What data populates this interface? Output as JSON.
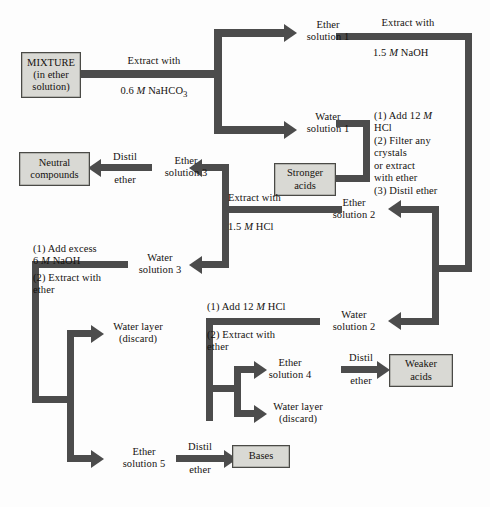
{
  "diagram": {
    "colors": {
      "connector": "#4c4c4c",
      "box_fill": "#d9d9d4",
      "box_border": "#4a4a46",
      "text": "#15120f",
      "background": "#ffffff"
    },
    "boxes": [
      {
        "id": "mixture",
        "label": "MIXTURE\n(in ether\nsolution)"
      },
      {
        "id": "neutral",
        "label": "Neutral\ncompounds"
      },
      {
        "id": "stronger_acids",
        "label": "Stronger\nacids"
      },
      {
        "id": "weaker_acids",
        "label": "Weaker\nacids"
      },
      {
        "id": "bases",
        "label": "Bases"
      }
    ],
    "nodes": [
      {
        "id": "ether1",
        "label": "Ether\nsolution 1"
      },
      {
        "id": "water1",
        "label": "Water\nsolution 1"
      },
      {
        "id": "ether2",
        "label": "Ether\nsolution 2"
      },
      {
        "id": "water2",
        "label": "Water\nsolution 2"
      },
      {
        "id": "ether3",
        "label": "Ether\nsolution 3"
      },
      {
        "id": "water3",
        "label": "Water\nsolution 3"
      },
      {
        "id": "ether4",
        "label": "Ether\nsolution 4"
      },
      {
        "id": "ether5",
        "label": "Ether\nsolution 5"
      },
      {
        "id": "water_layer_top",
        "label": "Water layer\n(discard)"
      },
      {
        "id": "water_layer_bottom",
        "label": "Water layer\n(discard)"
      }
    ],
    "edge_labels": {
      "extract_nahco3_line1": "Extract with",
      "extract_nahco3_line2_pre": "0.6 ",
      "extract_nahco3_m": "M",
      "extract_nahco3_line2_post": " NaHCO",
      "extract_nahco3_sub": "3",
      "extract_naoh_line1": "Extract with",
      "extract_naoh_line2_pre": "1.5 ",
      "extract_naoh_m": "M",
      "extract_naoh_line2_post": " NaOH",
      "distil_ether_top_1": "Distil",
      "distil_ether_top_2": "ether",
      "hcl_steps_1_pre": "(1) Add 12 ",
      "hcl_steps_1_m": "M",
      "hcl_steps_1_post": "\n      HCl",
      "hcl_steps_2": "(2) Filter any\n      crystals\n      or extract\n      with ether",
      "hcl_steps_3": "(3) Distil ether",
      "extract_hcl_line1": "Extract with",
      "extract_hcl_line2_pre": "1.5 ",
      "extract_hcl_m": "M",
      "extract_hcl_line2_post": " HCl",
      "naoh_excess_1_pre": "(1) Add excess\n      6 ",
      "naoh_excess_m": "M",
      "naoh_excess_1_post": " NaOH",
      "naoh_excess_2": "(2) Extract with\n      ether",
      "hcl12_1_pre": "(1) Add 12 ",
      "hcl12_m": "M",
      "hcl12_1_post": " HCl",
      "hcl12_2": "(2) Extract with\n      ether",
      "distil_ether_weak_1": "Distil",
      "distil_ether_weak_2": "ether",
      "distil_ether_bases_1": "Distil",
      "distil_ether_bases_2": "ether"
    }
  }
}
